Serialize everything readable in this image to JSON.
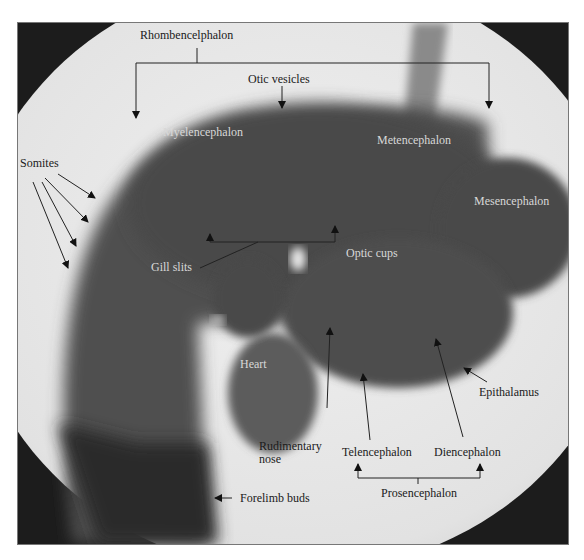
{
  "figure": {
    "colors": {
      "background": "#ffffff",
      "vignette": "#1c1c1c",
      "embryo": "#4e4e4e",
      "field": "#dedede",
      "label_dark": "#1a1a1a",
      "label_light": "#d8d8d8"
    }
  },
  "labels": {
    "rhombencephalon": "Rhombencelphalon",
    "otic_vesicles": "Otic vesicles",
    "myelencephalon": "Myelencephalon",
    "metencephalon": "Metencephalon",
    "mesencephalon": "Mesencephalon",
    "somites": "Somites",
    "gill_slits": "Gill slits",
    "optic_cups": "Optic cups",
    "heart": "Heart",
    "epithalamus": "Epithalamus",
    "rudimentary_nose_1": "Rudimentary",
    "rudimentary_nose_2": "nose",
    "telencephalon": "Telencephalon",
    "diencephalon": "Diencephalon",
    "prosencephalon": "Prosencephalon",
    "forelimb_buds": "Forelimb buds"
  }
}
